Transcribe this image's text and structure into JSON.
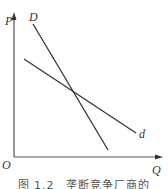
{
  "diagram": {
    "axes": {
      "y_label": "P",
      "x_label": "Q",
      "origin_label": "O"
    },
    "curves": [
      {
        "label": "D",
        "from": [
          33,
          24
        ],
        "to": [
          108,
          150
        ]
      },
      {
        "label": "d",
        "from": [
          24,
          59
        ],
        "to": [
          136,
          133
        ]
      }
    ],
    "caption": "图 1.2　垄断竞争厂商的"
  },
  "colors": {
    "line": "#333333",
    "axis": "#444444"
  }
}
